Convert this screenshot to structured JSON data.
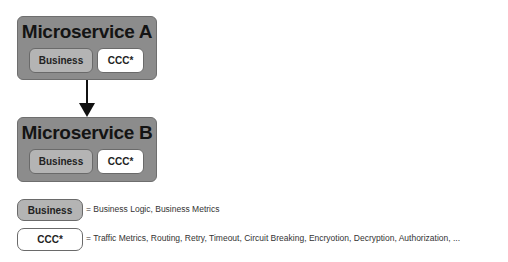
{
  "diagram": {
    "services": [
      {
        "title": "Microservice A",
        "components": [
          {
            "label": "Business",
            "style": "gray"
          },
          {
            "label": "CCC*",
            "style": "white"
          }
        ]
      },
      {
        "title": "Microservice B",
        "components": [
          {
            "label": "Business",
            "style": "gray"
          },
          {
            "label": "CCC*",
            "style": "white"
          }
        ]
      }
    ],
    "edges": [
      {
        "from": "Microservice A",
        "to": "Microservice B",
        "type": "arrow"
      }
    ],
    "legend": [
      {
        "key": "Business",
        "description": "= Business Logic, Business Metrics"
      },
      {
        "key": "CCC*",
        "description": "= Traffic Metrics, Routing, Retry, Timeout, Circuit Breaking, Encryotion, Decryption, Authorization, ..."
      }
    ]
  },
  "colors": {
    "service_fill": "#8c8c8c",
    "business_fill": "#b4b4b4",
    "ccc_fill": "#ffffff",
    "arrow": "#111111"
  }
}
